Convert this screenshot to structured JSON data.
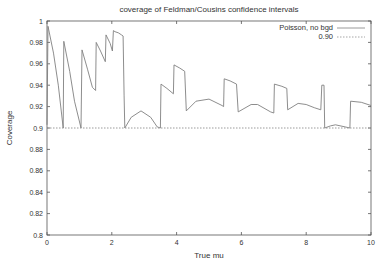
{
  "chart_data": {
    "type": "line",
    "title": "coverage of Feldman/Cousins confidence intervals",
    "xlabel": "True mu",
    "ylabel": "Coverage",
    "xlim": [
      0,
      10
    ],
    "ylim": [
      0.8,
      1.0
    ],
    "grid": false,
    "legend_position": "top-right",
    "x_ticks": [
      0,
      2,
      4,
      6,
      8,
      10
    ],
    "x_tick_labels": [
      "0",
      "2",
      "4",
      "6",
      "8",
      "10"
    ],
    "y_ticks": [
      0.8,
      0.82,
      0.84,
      0.86,
      0.88,
      0.9,
      0.92,
      0.94,
      0.96,
      0.98,
      1.0
    ],
    "y_tick_labels": [
      "0.8",
      "0.82",
      "0.84",
      "0.86",
      "0.88",
      "0.9",
      "0.92",
      "0.94",
      "0.96",
      "0.98",
      "1"
    ],
    "series": [
      {
        "name": "Poisson, no bgd",
        "style": "solid",
        "color": "#808080",
        "x": [
          0.0,
          0.03,
          0.2,
          0.35,
          0.5,
          0.52,
          0.7,
          0.85,
          1.05,
          1.08,
          1.25,
          1.4,
          1.5,
          1.52,
          1.65,
          1.8,
          1.82,
          1.95,
          2.02,
          2.05,
          2.1,
          2.2,
          2.3,
          2.35,
          2.38,
          2.4,
          2.6,
          2.9,
          3.2,
          3.4,
          3.5,
          3.52,
          3.7,
          3.9,
          3.92,
          4.1,
          4.25,
          4.3,
          4.6,
          5.0,
          5.4,
          5.45,
          5.47,
          5.65,
          5.85,
          5.9,
          6.3,
          6.5,
          6.9,
          7.0,
          7.02,
          7.25,
          7.4,
          7.43,
          7.75,
          8.0,
          8.25,
          8.45,
          8.48,
          8.55,
          8.57,
          8.75,
          8.9,
          9.2,
          9.35,
          9.37,
          9.7,
          10.0
        ],
        "y": [
          0.903,
          0.995,
          0.97,
          0.94,
          0.9,
          0.981,
          0.953,
          0.925,
          0.9,
          0.973,
          0.955,
          0.938,
          0.935,
          0.98,
          0.972,
          0.962,
          0.987,
          0.979,
          0.972,
          0.991,
          0.99,
          0.989,
          0.987,
          0.986,
          0.93,
          0.9,
          0.91,
          0.916,
          0.91,
          0.901,
          0.9,
          0.941,
          0.937,
          0.932,
          0.959,
          0.956,
          0.953,
          0.916,
          0.925,
          0.927,
          0.921,
          0.92,
          0.946,
          0.944,
          0.941,
          0.915,
          0.922,
          0.922,
          0.915,
          0.914,
          0.941,
          0.939,
          0.937,
          0.917,
          0.923,
          0.922,
          0.919,
          0.917,
          0.94,
          0.94,
          0.9,
          0.902,
          0.903,
          0.901,
          0.9,
          0.925,
          0.924,
          0.921
        ]
      },
      {
        "name": "0.90",
        "style": "dotted",
        "color": "#909090",
        "x": [
          0,
          10
        ],
        "y": [
          0.9,
          0.9
        ]
      }
    ]
  },
  "legend": {
    "entries": [
      {
        "label": "Poisson, no bgd",
        "style": "solid"
      },
      {
        "label": "0.90",
        "style": "dotted"
      }
    ]
  }
}
